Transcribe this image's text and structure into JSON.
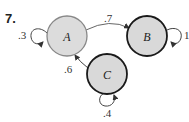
{
  "problem_number": "7.",
  "nodes": [
    {
      "id": "A",
      "label": "A"
    },
    {
      "id": "B",
      "label": "B"
    },
    {
      "id": "C",
      "label": "C"
    }
  ],
  "edges": [
    {
      "from": "A",
      "to": "A",
      "label": ".3"
    },
    {
      "from": "A",
      "to": "B",
      "label": ".7"
    },
    {
      "from": "B",
      "to": "B",
      "label": "1"
    },
    {
      "from": "C",
      "to": "A",
      "label": ".6"
    },
    {
      "from": "C",
      "to": "C",
      "label": ".4"
    }
  ],
  "colors": {
    "node_fill": "#dcdcdc",
    "node_stroke_A": "#888888",
    "node_stroke": "#1a1a1a",
    "edge": "#555555"
  }
}
